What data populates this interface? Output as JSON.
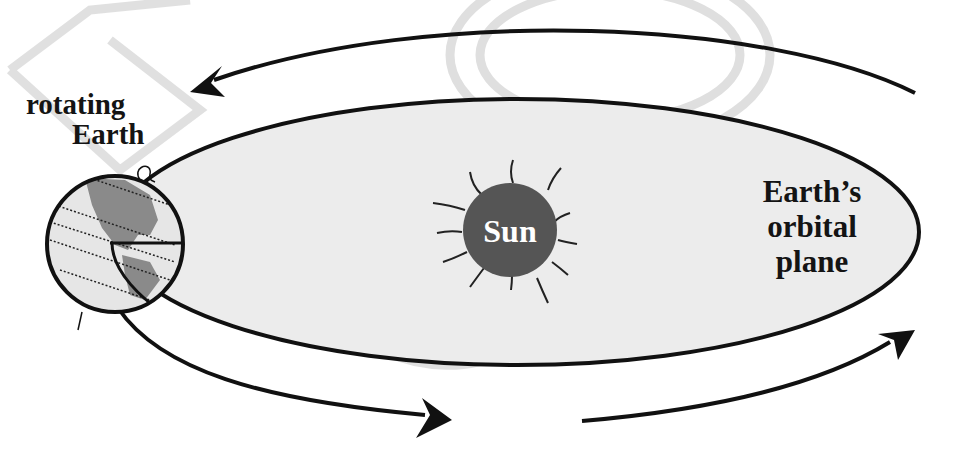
{
  "diagram": {
    "type": "orbital-diagram",
    "labels": {
      "earth_line1": "rotating",
      "earth_line2": "Earth",
      "sun": "Sun",
      "plane_line1": "Earth’s",
      "plane_line2": "orbital",
      "plane_line3": "plane"
    },
    "colors": {
      "background": "#ffffff",
      "orbital_plane_fill": "#ececec",
      "outline": "#111111",
      "sun_fill": "#555555",
      "earth_fill": "#e6e6e6",
      "continent_fill": "#8a8a8a",
      "watermark": "#d6d6d6"
    },
    "arrows": [
      {
        "name": "top-arrow",
        "direction": "right-to-left"
      },
      {
        "name": "bottom-left-arrow",
        "direction": "left-to-right"
      },
      {
        "name": "bottom-right-arrow",
        "direction": "left-to-right-up"
      }
    ]
  }
}
